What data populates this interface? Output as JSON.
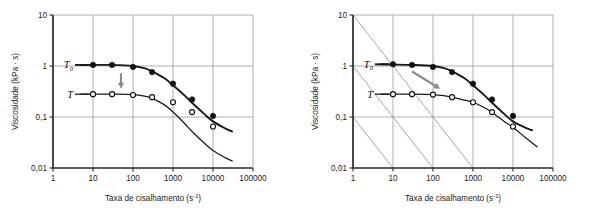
{
  "figure": {
    "panel_count": 2,
    "background": "#ffffff"
  },
  "axes": {
    "x_label_text": "Taxa de cisalhamento (s",
    "x_label_sup": "-1",
    "x_label_close": ")",
    "x_label_full": "Taxa de cisalhamento (s-1)",
    "y_label_full": "Viscosidade (kPa · s)",
    "x_ticks": [
      "1",
      "10",
      "100",
      "1000",
      "10000",
      "100000"
    ],
    "y_ticks": [
      "10",
      "1",
      "0,1",
      "0,01"
    ]
  },
  "labels": {
    "t_zero_base": "T",
    "t_zero_sub": "0",
    "t_base": "T"
  },
  "colors": {
    "axis": "#2b2b2b",
    "grid": "#9a9a9a",
    "diagonal_grid": "#8e8e8e",
    "curve": "#1a1a1a",
    "filled_marker": "#111111",
    "open_marker_fill": "#ffffff",
    "arrow": "#8a8a8a"
  },
  "chart_data": [
    {
      "id": "left-panel",
      "type": "line",
      "title": "",
      "xlabel": "Taxa de cisalhamento (s-1)",
      "ylabel": "Viscosidade (kPa · s)",
      "xscale": "log",
      "yscale": "log",
      "xlim": [
        1,
        100000
      ],
      "ylim": [
        0.01,
        10
      ],
      "grid": "rectangular",
      "legend_position": "inline-left",
      "annotations": [
        {
          "name": "arrow-down",
          "kind": "arrow",
          "direction": "down",
          "from_x": 50,
          "from_y": 0.72,
          "to_x": 50,
          "to_y": 0.36
        }
      ],
      "series": [
        {
          "name": "T0",
          "marker": "filled-circle",
          "label": "T0",
          "x": [
            10,
            30,
            100,
            300,
            1000,
            3000,
            10000
          ],
          "y": [
            1.05,
            1.05,
            0.96,
            0.76,
            0.45,
            0.22,
            0.105
          ]
        },
        {
          "name": "T",
          "marker": "open-circle",
          "label": "T",
          "x": [
            10,
            30,
            100,
            300,
            1000,
            3000,
            10000
          ],
          "y": [
            0.28,
            0.28,
            0.27,
            0.245,
            0.195,
            0.125,
            0.065
          ]
        }
      ],
      "fit_curves": [
        {
          "name": "T0-fit",
          "style": "thick",
          "x": [
            5,
            10,
            30,
            100,
            200,
            300,
            600,
            1000,
            2000,
            3000,
            6000,
            10000,
            20000,
            30000
          ],
          "y": [
            1.05,
            1.05,
            1.05,
            1.0,
            0.9,
            0.78,
            0.58,
            0.42,
            0.26,
            0.19,
            0.115,
            0.082,
            0.06,
            0.052
          ]
        },
        {
          "name": "T-fit",
          "style": "thin",
          "x": [
            5,
            10,
            30,
            100,
            200,
            300,
            600,
            1000,
            2000,
            3000,
            6000,
            10000,
            20000,
            30000
          ],
          "y": [
            0.28,
            0.28,
            0.28,
            0.275,
            0.255,
            0.232,
            0.175,
            0.125,
            0.073,
            0.052,
            0.031,
            0.022,
            0.016,
            0.0138
          ]
        }
      ]
    },
    {
      "id": "right-panel",
      "type": "line",
      "title": "",
      "xlabel": "Taxa de cisalhamento (s-1)",
      "ylabel": "Viscosidade (kPa · s)",
      "xscale": "log",
      "yscale": "log",
      "xlim": [
        1,
        100000
      ],
      "ylim": [
        0.01,
        10
      ],
      "grid": "rectangular+diagonal",
      "diagonal_slope": -1,
      "legend_position": "inline-left",
      "annotations": [
        {
          "name": "arrow-diagonal",
          "kind": "arrow",
          "direction": "down-right",
          "from_x": 30,
          "from_y": 0.78,
          "to_x": 150,
          "to_y": 0.36
        }
      ],
      "series": [
        {
          "name": "T0",
          "marker": "filled-circle",
          "label": "T0",
          "x": [
            10,
            30,
            100,
            300,
            1000,
            3000,
            10000
          ],
          "y": [
            1.08,
            1.05,
            0.96,
            0.76,
            0.45,
            0.22,
            0.105
          ]
        },
        {
          "name": "T",
          "marker": "open-circle",
          "label": "T",
          "x": [
            10,
            30,
            100,
            300,
            1000,
            3000,
            10000
          ],
          "y": [
            0.28,
            0.28,
            0.275,
            0.245,
            0.195,
            0.125,
            0.065
          ]
        }
      ],
      "fit_curves": [
        {
          "name": "T0-fit",
          "style": "thick",
          "x": [
            5,
            10,
            30,
            100,
            200,
            300,
            600,
            1000,
            2000,
            3000,
            6000,
            10000,
            20000,
            30000
          ],
          "y": [
            1.08,
            1.07,
            1.05,
            1.0,
            0.9,
            0.78,
            0.58,
            0.42,
            0.26,
            0.19,
            0.115,
            0.082,
            0.062,
            0.055
          ]
        },
        {
          "name": "T-fit",
          "style": "thin",
          "x": [
            5,
            10,
            30,
            100,
            200,
            300,
            600,
            1000,
            2000,
            3000,
            6000,
            10000,
            20000,
            40000
          ],
          "y": [
            0.28,
            0.28,
            0.28,
            0.275,
            0.26,
            0.245,
            0.215,
            0.195,
            0.15,
            0.122,
            0.082,
            0.063,
            0.04,
            0.026
          ]
        }
      ]
    }
  ]
}
